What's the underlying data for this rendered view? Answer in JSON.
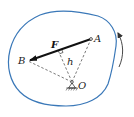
{
  "diagram": {
    "type": "moment-of-force",
    "colors": {
      "body_outline": "#3a78b8",
      "force": "#111111",
      "dashed": "#555555",
      "rotation_arrow": "#333333"
    },
    "labels": {
      "point_a": "A",
      "point_b": "B",
      "point_o": "O",
      "force": "F",
      "distance": "h"
    },
    "points": {
      "A": [
        91,
        39
      ],
      "B": [
        28,
        61
      ],
      "O": [
        72,
        82
      ],
      "foot": [
        58,
        50
      ]
    }
  }
}
